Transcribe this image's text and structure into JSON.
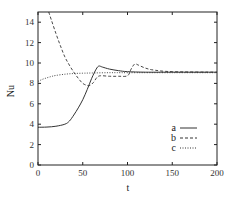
{
  "chart_data": {
    "type": "line",
    "title": "",
    "xlabel": "t",
    "ylabel": "Nu",
    "xlim": [
      0,
      200
    ],
    "ylim": [
      0,
      15
    ],
    "xticks": [
      0,
      50,
      100,
      150,
      200
    ],
    "yticks": [
      0,
      2,
      4,
      6,
      8,
      10,
      12,
      14
    ],
    "grid": false,
    "legend_position": "right-middle inside",
    "series": [
      {
        "name": "a",
        "style": "solid",
        "x": [
          0,
          10,
          20,
          30,
          35,
          40,
          45,
          50,
          55,
          60,
          65,
          68,
          72,
          80,
          90,
          100,
          120,
          150,
          200
        ],
        "y": [
          3.7,
          3.72,
          3.8,
          4.0,
          4.3,
          4.9,
          5.6,
          6.4,
          7.4,
          8.5,
          9.4,
          9.7,
          9.6,
          9.4,
          9.25,
          9.15,
          9.1,
          9.1,
          9.1
        ]
      },
      {
        "name": "b",
        "style": "dashed",
        "x": [
          12,
          15,
          20,
          25,
          30,
          35,
          40,
          45,
          50,
          55,
          58,
          62,
          66,
          70,
          80,
          90,
          100,
          104,
          108,
          112,
          120,
          130,
          150,
          200
        ],
        "y": [
          15,
          14.2,
          12.9,
          11.7,
          10.6,
          9.8,
          9.1,
          8.5,
          8.0,
          7.8,
          7.8,
          8.1,
          8.6,
          8.75,
          8.7,
          8.7,
          8.75,
          9.4,
          9.9,
          9.8,
          9.5,
          9.3,
          9.15,
          9.1
        ]
      },
      {
        "name": "c",
        "style": "dotted",
        "x": [
          0,
          5,
          10,
          15,
          20,
          30,
          40,
          50,
          60,
          80,
          100,
          150,
          200
        ],
        "y": [
          8.2,
          8.4,
          8.55,
          8.68,
          8.78,
          8.9,
          8.97,
          9.0,
          9.02,
          9.05,
          9.05,
          9.05,
          9.05
        ]
      }
    ]
  },
  "legend": {
    "items": [
      {
        "label": "a",
        "style": "solid"
      },
      {
        "label": "b",
        "style": "dashed"
      },
      {
        "label": "c",
        "style": "dotted"
      }
    ]
  },
  "axes": {
    "xlabel": "t",
    "ylabel": "Nu",
    "xtick_labels": [
      "0",
      "50",
      "100",
      "150",
      "200"
    ],
    "ytick_labels": [
      "0",
      "2",
      "4",
      "6",
      "8",
      "10",
      "12",
      "14"
    ]
  },
  "colors": {
    "line": "#333333",
    "frame": "#222222",
    "background": "#ffffff"
  }
}
